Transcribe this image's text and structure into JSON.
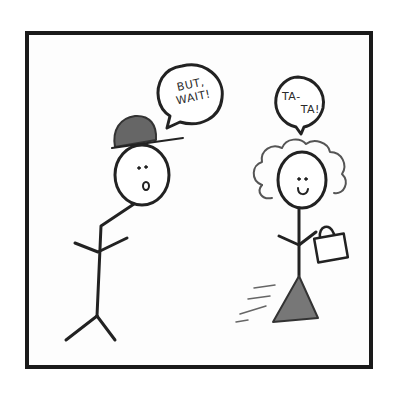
{
  "comic": {
    "left_character": {
      "speech": {
        "line1": "BUT,",
        "line2": "WAIT!"
      },
      "hat": "cap",
      "expression": "surprised"
    },
    "right_character": {
      "speech": {
        "line1": "TA-",
        "line2": "TA!"
      },
      "accessory": "handbag",
      "expression": "smiling"
    }
  }
}
